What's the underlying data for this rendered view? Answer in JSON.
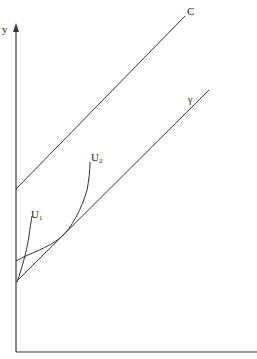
{
  "diagram": {
    "axes": {
      "y_label": "y",
      "x_label": ""
    },
    "lines": [
      {
        "name": "C",
        "label": "C"
      },
      {
        "name": "gamma",
        "label": "γ"
      }
    ],
    "curves": [
      {
        "name": "U1",
        "label_main": "U",
        "label_sub": "1"
      },
      {
        "name": "U2",
        "label_main": "U",
        "label_sub": "2"
      }
    ],
    "colors": {
      "line": "#333333",
      "background": "#ffffff"
    }
  }
}
